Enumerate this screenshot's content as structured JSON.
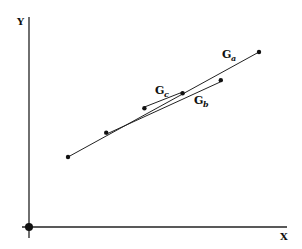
{
  "diagram": {
    "axes": {
      "x_label": "X",
      "y_label": "Y"
    },
    "points": [
      {
        "x": 0.0,
        "y": 0.0
      },
      {
        "x": 1.0,
        "y": 0.65
      },
      {
        "x": 2.0,
        "y": 1.3
      },
      {
        "x": 3.0,
        "y": 1.7
      },
      {
        "x": 4.0,
        "y": 2.05
      },
      {
        "x": 5.0,
        "y": 2.8
      }
    ],
    "lines": [
      {
        "name": "G",
        "sub": "a",
        "from": 0,
        "to": 5
      },
      {
        "name": "G",
        "sub": "b",
        "from": 1,
        "to": 4
      },
      {
        "name": "G",
        "sub": "c",
        "from": 2,
        "to": 3
      }
    ],
    "origin_marker": true
  }
}
